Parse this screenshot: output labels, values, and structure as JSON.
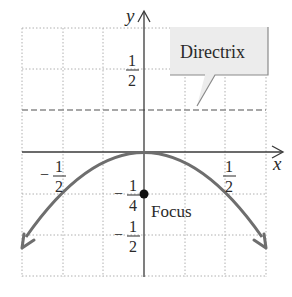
{
  "diagram": {
    "axes": {
      "x_label": "x",
      "y_label": "y"
    },
    "tick_labels": {
      "x_neg_half": {
        "sign": "−",
        "num": "1",
        "den": "2"
      },
      "x_pos_half": {
        "sign": "",
        "num": "1",
        "den": "2"
      },
      "y_pos_half": {
        "sign": "",
        "num": "1",
        "den": "2"
      },
      "y_neg_quarter": {
        "sign": "−",
        "num": "1",
        "den": "4"
      },
      "y_neg_half": {
        "sign": "−",
        "num": "1",
        "den": "2"
      }
    },
    "callout": {
      "label": "Directrix"
    },
    "focus": {
      "label": "Focus",
      "x": 0,
      "y": -0.25
    },
    "directrix": {
      "y": 0.25
    },
    "parabola": {
      "equation": "y = -x^2",
      "x_range": [
        -0.75,
        0.75
      ]
    },
    "grid": {
      "step": 0.25,
      "x_range": [
        -0.75,
        0.75
      ],
      "y_range": [
        -0.75,
        0.75
      ]
    },
    "colors": {
      "axis": "#3a3a3a",
      "grid": "#b0b0b0",
      "curve": "#6e6e6e",
      "directrix": "#8a8a8a",
      "callout_fill": "#ececec",
      "callout_border": "#8a8a8a",
      "focus_dot": "#111111"
    }
  }
}
